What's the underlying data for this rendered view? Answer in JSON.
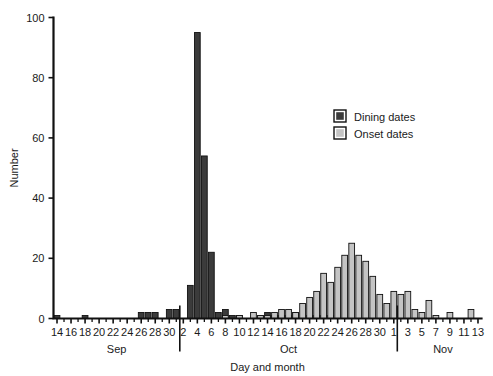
{
  "figure": {
    "background_color": "#ffffff",
    "width": 493,
    "height": 376
  },
  "chart_data": {
    "type": "bar",
    "title": "",
    "subtitle": "",
    "xlabel": "Day and month",
    "ylabel": "Number",
    "ylim": [
      0,
      100
    ],
    "yticks": [
      0,
      20,
      40,
      60,
      80,
      100
    ],
    "ytick_labels": [
      "0",
      "20",
      "40",
      "60",
      "80",
      "100"
    ],
    "grid": false,
    "legend_position": "upper right",
    "legend": [
      "Dining dates",
      "Onset dates"
    ],
    "colors": {
      "dining": "#3b3b3b",
      "onset": "#c4c4c4",
      "outline": "#111111",
      "axis": "#111111",
      "text": "#1a1a1a"
    },
    "month_groups": [
      {
        "label": "Sep",
        "start_index": 0,
        "end_index": 17
      },
      {
        "label": "Oct",
        "start_index": 18,
        "end_index": 48
      },
      {
        "label": "Nov",
        "start_index": 49,
        "end_index": 61
      }
    ],
    "xtick_labels": [
      "14",
      "16",
      "18",
      "20",
      "22",
      "24",
      "26",
      "28",
      "30",
      "2",
      "4",
      "6",
      "8",
      "10",
      "12",
      "14",
      "16",
      "18",
      "20",
      "22",
      "24",
      "26",
      "28",
      "30",
      "1",
      "3",
      "5",
      "7",
      "9",
      "11",
      "13"
    ],
    "categories": [
      "Sep 14",
      "Sep 15",
      "Sep 16",
      "Sep 17",
      "Sep 18",
      "Sep 19",
      "Sep 20",
      "Sep 21",
      "Sep 22",
      "Sep 23",
      "Sep 24",
      "Sep 25",
      "Sep 26",
      "Sep 27",
      "Sep 28",
      "Sep 29",
      "Sep 30",
      "Oct 1",
      "Oct 2",
      "Oct 3",
      "Oct 4",
      "Oct 5",
      "Oct 6",
      "Oct 7",
      "Oct 8",
      "Oct 9",
      "Oct 10",
      "Oct 11",
      "Oct 12",
      "Oct 13",
      "Oct 14",
      "Oct 15",
      "Oct 16",
      "Oct 17",
      "Oct 18",
      "Oct 19",
      "Oct 20",
      "Oct 21",
      "Oct 22",
      "Oct 23",
      "Oct 24",
      "Oct 25",
      "Oct 26",
      "Oct 27",
      "Oct 28",
      "Oct 29",
      "Oct 30",
      "Oct 31",
      "Nov 1",
      "Nov 2",
      "Nov 3",
      "Nov 4",
      "Nov 5",
      "Nov 6",
      "Nov 7",
      "Nov 8",
      "Nov 9",
      "Nov 10",
      "Nov 11",
      "Nov 12",
      "Nov 13"
    ],
    "series": [
      {
        "name": "Dining dates",
        "color": "#3b3b3b",
        "values": [
          1,
          0,
          0,
          0,
          1,
          0,
          0,
          0,
          0,
          0,
          0,
          0,
          2,
          2,
          2,
          0,
          3,
          3,
          0,
          11,
          95,
          54,
          22,
          2,
          3,
          1,
          1,
          0,
          0,
          1,
          2,
          1,
          1,
          1,
          2,
          0,
          1,
          1,
          1,
          1,
          0,
          0,
          0,
          0,
          0,
          0,
          0,
          0,
          0,
          0,
          0,
          0,
          0,
          0,
          0,
          0,
          0,
          0,
          0,
          0,
          0
        ]
      },
      {
        "name": "Onset dates",
        "color": "#c4c4c4",
        "values": [
          0,
          0,
          0,
          0,
          0,
          0,
          0,
          0,
          0,
          0,
          0,
          0,
          0,
          0,
          0,
          0,
          0,
          0,
          0,
          0,
          0,
          0,
          0,
          0,
          1,
          0,
          1,
          0,
          2,
          1,
          1,
          2,
          3,
          3,
          2,
          5,
          7,
          9,
          15,
          12,
          17,
          21,
          25,
          21,
          19,
          14,
          8,
          5,
          9,
          8,
          9,
          3,
          2,
          6,
          1,
          0,
          2,
          0,
          0,
          3,
          0
        ]
      }
    ],
    "annotations": [
      "Tall dark bar at Oct 4 reaches 95",
      "Second dark bar at Oct 5 reaches 54",
      "Light gray onset peak near Oct 26 reaches 25"
    ]
  },
  "axes": {
    "y_axis_title": "Number",
    "x_axis_title": "Day and month"
  }
}
